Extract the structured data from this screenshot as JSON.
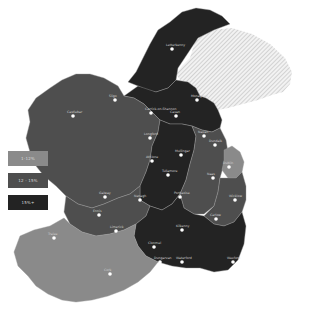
{
  "map": {
    "colors": {
      "low": "#8a8a8a",
      "mid": "#4e4e4e",
      "high": "#232323",
      "border": "#9a9a9a",
      "hatch_bg": "#f2f2f2",
      "hatch_line": "#bdbdbd",
      "town_dot": "#ffffff"
    }
  },
  "legend": {
    "items": [
      {
        "label": "1-12%",
        "color": "#8a8a8a"
      },
      {
        "label": "12 - 15%",
        "color": "#4e4e4e"
      },
      {
        "label": "15%+",
        "color": "#232323"
      }
    ]
  },
  "towns": [
    {
      "name": "Letterkenny",
      "x": 172,
      "y": 49
    },
    {
      "name": "Sligo",
      "x": 115,
      "y": 100
    },
    {
      "name": "Castlebar",
      "x": 73,
      "y": 116
    },
    {
      "name": "Carrick-on-Shannon",
      "x": 151,
      "y": 113
    },
    {
      "name": "Cavan",
      "x": 176,
      "y": 116
    },
    {
      "name": "Monaghan",
      "x": 197,
      "y": 100
    },
    {
      "name": "Dundalk",
      "x": 215,
      "y": 145
    },
    {
      "name": "Longford",
      "x": 150,
      "y": 138
    },
    {
      "name": "Mullingar",
      "x": 181,
      "y": 155
    },
    {
      "name": "Navan",
      "x": 204,
      "y": 136
    },
    {
      "name": "Dublin",
      "x": 229,
      "y": 167
    },
    {
      "name": "Athlone",
      "x": 152,
      "y": 161
    },
    {
      "name": "Galway",
      "x": 105,
      "y": 197
    },
    {
      "name": "Tullamore",
      "x": 168,
      "y": 175
    },
    {
      "name": "Portlaoise",
      "x": 180,
      "y": 197
    },
    {
      "name": "Naas",
      "x": 213,
      "y": 178
    },
    {
      "name": "Wicklow",
      "x": 235,
      "y": 200
    },
    {
      "name": "Carlow",
      "x": 216,
      "y": 219
    },
    {
      "name": "Kilkenny",
      "x": 182,
      "y": 230
    },
    {
      "name": "Ennis",
      "x": 99,
      "y": 215
    },
    {
      "name": "Limerick",
      "x": 116,
      "y": 231
    },
    {
      "name": "Nenagh",
      "x": 140,
      "y": 200
    },
    {
      "name": "Clonmel",
      "x": 154,
      "y": 247
    },
    {
      "name": "Wexford",
      "x": 233,
      "y": 262
    },
    {
      "name": "Waterford",
      "x": 182,
      "y": 262
    },
    {
      "name": "Dungarvan",
      "x": 160,
      "y": 262
    },
    {
      "name": "Tralee",
      "x": 54,
      "y": 238
    },
    {
      "name": "Cork",
      "x": 110,
      "y": 274
    }
  ]
}
